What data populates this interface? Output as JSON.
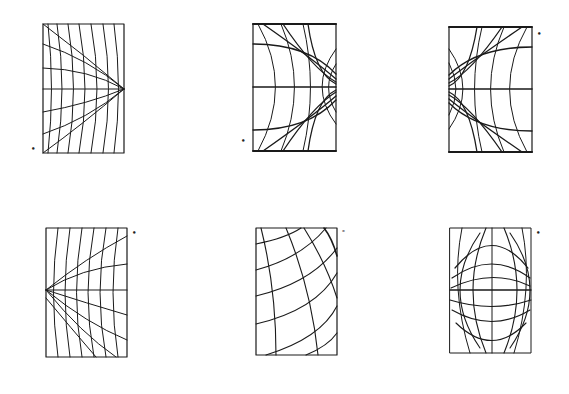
{
  "figure": {
    "title": "",
    "ink_color": "#1a1a1a",
    "background": "#ffffff",
    "panels": [
      {
        "id": "p1",
        "row": 1,
        "col": 1,
        "label_mark": "•",
        "grid": "fan-right",
        "vanishing_point": "right-middle",
        "frame": {
          "x": 43,
          "y": 24,
          "w": 81,
          "h": 129
        }
      },
      {
        "id": "p2",
        "row": 1,
        "col": 2,
        "label_mark": "•",
        "grid": "dipole-right",
        "vanishing_point": "right-middle",
        "frame": {
          "x": 253,
          "y": 24,
          "w": 83,
          "h": 127
        }
      },
      {
        "id": "p3",
        "row": 1,
        "col": 3,
        "label_mark": "•",
        "grid": "dipole-left",
        "vanishing_point": "left-middle",
        "frame": {
          "x": 449,
          "y": 27,
          "w": 83,
          "h": 125
        }
      },
      {
        "id": "p4",
        "row": 2,
        "col": 1,
        "label_mark": "•",
        "grid": "fan-left",
        "vanishing_point": "left-middle",
        "frame": {
          "x": 46,
          "y": 228,
          "w": 81,
          "h": 129
        }
      },
      {
        "id": "p5",
        "row": 2,
        "col": 2,
        "label_mark": "-",
        "grid": "curved-diagonal",
        "vanishing_point": "none",
        "frame": {
          "x": 256,
          "y": 228,
          "w": 81,
          "h": 127
        }
      },
      {
        "id": "p6",
        "row": 2,
        "col": 3,
        "label_mark": "•",
        "grid": "fisheye-ellipse",
        "vanishing_point": "top-bottom",
        "frame": {
          "x": 450,
          "y": 228,
          "w": 81,
          "h": 125
        }
      }
    ]
  }
}
